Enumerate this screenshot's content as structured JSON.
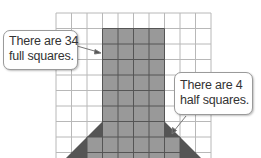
{
  "colors": {
    "grid_line": "#b8b8b8",
    "shape_fill": "#999999",
    "shape_line": "#555555",
    "half_square_fill": "#555555",
    "callout_border": "#9a9a9a",
    "text": "#333333"
  },
  "grid": {
    "left": 56,
    "top": 13,
    "cell": 15.45,
    "cols": 10,
    "rows": 10
  },
  "callouts": [
    {
      "id": "full-squares",
      "lines": [
        "There are 34",
        "full squares."
      ]
    },
    {
      "id": "half-squares",
      "lines": [
        "There are 4",
        "half squares."
      ]
    }
  ]
}
